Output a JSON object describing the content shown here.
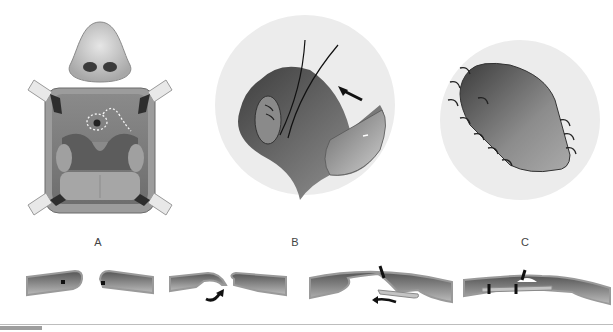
{
  "figure": {
    "panels": [
      {
        "id": "A",
        "label": "A",
        "description": "Oral cavity view with retractors; dotted outline marks fistula and incision line on palate"
      },
      {
        "id": "B",
        "label": "B",
        "description": "Rotated flap being sutured into fistula; arrow indicates direction of rotation"
      },
      {
        "id": "C",
        "label": "C",
        "description": "Flap sutured in final position with interrupted stitches"
      }
    ],
    "cross_sections": [
      {
        "id": "cs-1",
        "description": "Fistula margins with suture points"
      },
      {
        "id": "cs-2",
        "description": "Nasal layer turned over; curved arrow"
      },
      {
        "id": "cs-3",
        "description": "Flap elevated and advanced; left arrow"
      },
      {
        "id": "cs-4",
        "description": "Layered closure with sutures"
      }
    ]
  },
  "colors": {
    "tissue_dark": "#4a4a4a",
    "tissue_mid": "#7a7a7a",
    "tissue_light": "#b8b8b8",
    "mucosa": "#c8c8c8",
    "circle_bg": "#ececec",
    "suture": "#222222",
    "label": "#444444"
  }
}
